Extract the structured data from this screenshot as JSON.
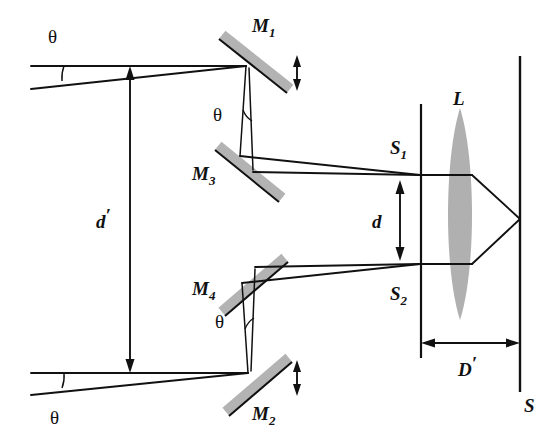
{
  "figure": {
    "background_color": "#ffffff",
    "ink_color": "#111111",
    "mirror_color": "#b3b3b3",
    "lens_color": "#b0b0b0"
  },
  "labels": {
    "mirror_1": "M",
    "mirror_1_sub": "1",
    "mirror_2": "M",
    "mirror_2_sub": "2",
    "mirror_3": "M",
    "mirror_3_sub": "3",
    "mirror_4": "M",
    "mirror_4_sub": "4",
    "slit_1": "S",
    "slit_1_sub": "1",
    "slit_2": "S",
    "slit_2_sub": "2",
    "lens": "L",
    "screen": "S",
    "separation_d": "d",
    "separation_d_prime": "d",
    "separation_d_prime_mark": "′",
    "distance_D_prime": "D",
    "distance_D_prime_mark": "′",
    "angle_top_left": "θ",
    "angle_bottom_left": "θ",
    "angle_upper_mirror": "θ",
    "angle_lower_mirror": "θ"
  },
  "components": {
    "mirrors": [
      {
        "name": "M1",
        "role": "upper-steering-mirror",
        "adjustable": true
      },
      {
        "name": "M2",
        "role": "lower-steering-mirror",
        "adjustable": true
      },
      {
        "name": "M3",
        "role": "upper-folding-mirror",
        "adjustable": false
      },
      {
        "name": "M4",
        "role": "lower-folding-mirror",
        "adjustable": false
      }
    ],
    "slits": [
      "S1",
      "S2"
    ],
    "lens": "L",
    "screen": "S"
  },
  "dimensions": {
    "d_description": "slit separation between S1 and S2",
    "d_prime_description": "separation between incoming beams at left",
    "D_prime_description": "distance from slit plane to screen S"
  }
}
